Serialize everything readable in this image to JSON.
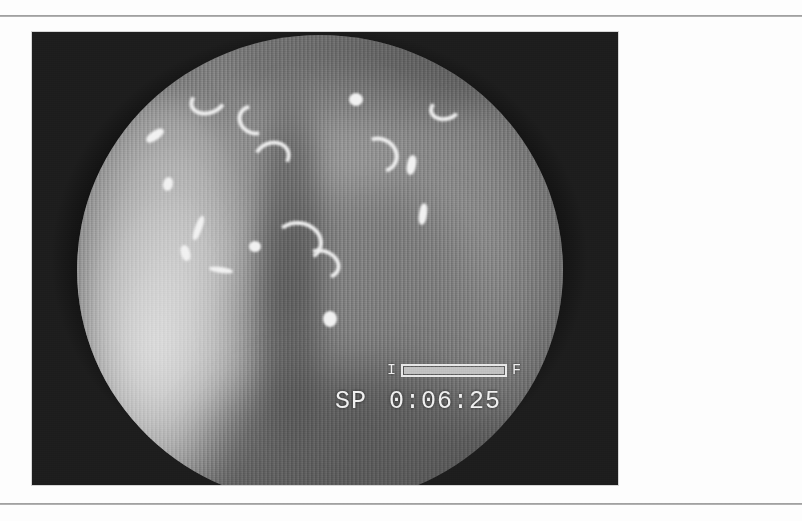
{
  "page": {
    "background_color": "#fdfdfd",
    "rule_color": "#8d8d8d",
    "top_rule_y": 15,
    "bottom_rule_y": 503
  },
  "figure": {
    "kind": "endoscopic-photograph",
    "modality": "flexible endoscopy video still",
    "color_mode": "grayscale",
    "frame": {
      "x": 32,
      "y": 32,
      "width": 586,
      "height": 453
    },
    "field_of_view_shape": "circular",
    "vignette_color": "#1d1d1d",
    "tissue_mid_tone": "#8e8e8e"
  },
  "osd": {
    "level_bar": {
      "left_label": "I",
      "right_label": "F",
      "fill_percent": 100,
      "border_color": "#e8e8e8",
      "fill_color": "#c2c2c2"
    },
    "status": {
      "mode_label": "SP",
      "timecode": "0:06:25"
    },
    "text_color": "#f0f0f0"
  },
  "highlights": [
    {
      "name": "specular-arc-top-left",
      "x": 112,
      "y": 52,
      "w": 30,
      "h": 20,
      "rot": -18,
      "type": "arc"
    },
    {
      "name": "specular-arc-top-center",
      "x": 160,
      "y": 70,
      "w": 26,
      "h": 22,
      "rot": 30,
      "type": "arc"
    },
    {
      "name": "specular-streak-upper-left",
      "x": 68,
      "y": 96,
      "w": 20,
      "h": 9,
      "rot": -35,
      "type": "streak"
    },
    {
      "name": "specular-arc-upper-mid",
      "x": 176,
      "y": 106,
      "w": 30,
      "h": 24,
      "rot": 160,
      "type": "arc"
    },
    {
      "name": "specular-dot-left-edge",
      "x": 86,
      "y": 142,
      "w": 10,
      "h": 14,
      "rot": 12,
      "type": "dot"
    },
    {
      "name": "specular-dot-upper-right",
      "x": 272,
      "y": 58,
      "w": 14,
      "h": 13,
      "rot": 0,
      "type": "dot"
    },
    {
      "name": "specular-arc-right-upper",
      "x": 282,
      "y": 102,
      "w": 32,
      "h": 28,
      "rot": 205,
      "type": "arc"
    },
    {
      "name": "specular-streak-right",
      "x": 330,
      "y": 120,
      "w": 9,
      "h": 20,
      "rot": 10,
      "type": "streak"
    },
    {
      "name": "specular-arc-far-right",
      "x": 352,
      "y": 62,
      "w": 24,
      "h": 16,
      "rot": -10,
      "type": "arc"
    },
    {
      "name": "specular-streak-right-low",
      "x": 342,
      "y": 168,
      "w": 8,
      "h": 22,
      "rot": 8,
      "type": "streak"
    },
    {
      "name": "specular-arc-center-low",
      "x": 196,
      "y": 186,
      "w": 42,
      "h": 34,
      "rot": 185,
      "type": "arc"
    },
    {
      "name": "specular-dot-center-low",
      "x": 172,
      "y": 206,
      "w": 12,
      "h": 11,
      "rot": 0,
      "type": "dot"
    },
    {
      "name": "specular-arc-center-bottom",
      "x": 226,
      "y": 214,
      "w": 30,
      "h": 22,
      "rot": 200,
      "type": "arc"
    },
    {
      "name": "specular-dot-mid-field",
      "x": 246,
      "y": 276,
      "w": 14,
      "h": 16,
      "rot": 0,
      "type": "dot"
    },
    {
      "name": "specular-streak-left-fold",
      "x": 118,
      "y": 180,
      "w": 7,
      "h": 26,
      "rot": 20,
      "type": "streak"
    },
    {
      "name": "specular-streak-left-fold2",
      "x": 104,
      "y": 210,
      "w": 9,
      "h": 16,
      "rot": -15,
      "type": "streak"
    },
    {
      "name": "specular-streak-left-edge",
      "x": 132,
      "y": 232,
      "w": 24,
      "h": 6,
      "rot": 8,
      "type": "streak"
    }
  ]
}
